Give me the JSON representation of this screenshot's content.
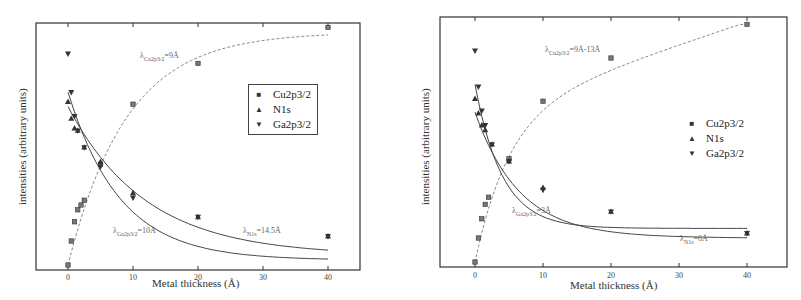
{
  "chart_data": [
    {
      "type": "scatter",
      "panel": "left",
      "title": "",
      "xlabel": "Metal thickness (Å)",
      "ylabel": "intensities (arbitrary units)",
      "xlim": [
        -5,
        45
      ],
      "ylim": [
        0,
        1
      ],
      "x_ticks": [
        "0",
        "10",
        "20",
        "30",
        "40"
      ],
      "grid": false,
      "legend": {
        "position": "upper right (boxed)",
        "entries": [
          "Cu2p3/2",
          "N1s",
          "Ga2p3/2"
        ]
      },
      "series": [
        {
          "name": "Cu2p3/2",
          "marker": "square",
          "x": [
            0,
            0.5,
            1,
            1.5,
            2,
            2.5,
            5,
            10,
            20,
            40
          ],
          "values": [
            0.0,
            0.1,
            0.18,
            0.23,
            0.25,
            0.27,
            0.42,
            0.67,
            0.84,
            0.99
          ]
        },
        {
          "name": "N1s",
          "marker": "triangle-up",
          "x": [
            0,
            0.5,
            1,
            1.5,
            2.5,
            5,
            10,
            20,
            40
          ],
          "values": [
            0.68,
            0.61,
            0.57,
            0.56,
            0.49,
            0.43,
            0.3,
            0.2,
            0.12
          ]
        },
        {
          "name": "Ga2p3/2",
          "marker": "triangle-down",
          "x": [
            0,
            0.5,
            1,
            1.5,
            2.5,
            5,
            10,
            20,
            40
          ],
          "values": [
            0.88,
            0.72,
            0.62,
            0.56,
            0.49,
            0.41,
            0.28,
            0.2,
            0.12
          ]
        }
      ],
      "fits": [
        {
          "name": "Cu2p3/2 fit",
          "style": "dashed",
          "label": "λCu2p3/2=9Å"
        },
        {
          "name": "Ga2p3/2 fit",
          "style": "solid",
          "label": "λGa2p3/2=10Å"
        },
        {
          "name": "N1s fit",
          "style": "solid",
          "label": "λN1s=14.5Å"
        }
      ]
    },
    {
      "type": "scatter",
      "panel": "right",
      "title": "",
      "xlabel": "Metal thickness (Å)",
      "ylabel": "intensities (arbitrary units)",
      "xlim": [
        -5,
        45
      ],
      "ylim": [
        0,
        1
      ],
      "x_ticks": [
        "0",
        "10",
        "20",
        "30",
        "40"
      ],
      "grid": false,
      "legend": {
        "position": "center right (no box)",
        "entries": [
          "Cu2p3/2",
          "N1s",
          "Ga2p3/2"
        ]
      },
      "series": [
        {
          "name": "Cu2p3/2",
          "marker": "square",
          "x": [
            0,
            0.5,
            1,
            1.5,
            2,
            5,
            10,
            20,
            40
          ],
          "values": [
            0.0,
            0.1,
            0.18,
            0.24,
            0.27,
            0.43,
            0.67,
            0.85,
            0.99
          ]
        },
        {
          "name": "N1s",
          "marker": "triangle-up",
          "x": [
            0,
            0.5,
            1,
            1.5,
            2.5,
            5,
            10,
            20,
            40
          ],
          "values": [
            0.68,
            0.62,
            0.57,
            0.55,
            0.49,
            0.42,
            0.31,
            0.21,
            0.12
          ]
        },
        {
          "name": "Ga2p3/2",
          "marker": "triangle-down",
          "x": [
            0,
            0.5,
            1,
            1.5,
            2.5,
            5,
            10,
            20,
            40
          ],
          "values": [
            0.88,
            0.73,
            0.63,
            0.57,
            0.49,
            0.42,
            0.3,
            0.21,
            0.12
          ]
        }
      ],
      "fits": [
        {
          "name": "Cu2p3/2 fit",
          "style": "dashed",
          "label": "λCu2p3/2=9Å-13Å"
        },
        {
          "name": "Ga2p3/2 fit",
          "style": "solid",
          "label": "λGa2p3/2=3Å"
        },
        {
          "name": "N1s fit",
          "style": "solid",
          "label": "λN1s=6Å"
        }
      ]
    }
  ],
  "left": {
    "ylabel": "intensities (arbitrary units)",
    "xlabel": "Metal thickness (Å)",
    "ticks": [
      "0",
      "10",
      "20",
      "30",
      "40"
    ],
    "legend": [
      "Cu2p3/2",
      "N1s",
      "Ga2p3/2"
    ],
    "annot_cu": "=9Å",
    "annot_cu_sub": "Cu2p3/2",
    "annot_ga": "=10Å",
    "annot_ga_sub": "Ga2p3/2",
    "annot_n": "=14.5Å",
    "annot_n_sub": "N1s",
    "lambda": "λ"
  },
  "right": {
    "ylabel": "intensities (arbitrary units)",
    "xlabel": "Metal thickness (Å)",
    "ticks": [
      "0",
      "10",
      "20",
      "30",
      "40"
    ],
    "legend": [
      "Cu2p3/2",
      "N1s",
      "Ga2p3/2"
    ],
    "annot_cu": "=9Å-13Å",
    "annot_cu_sub": "Cu2p3/2",
    "annot_ga": "=3Å",
    "annot_ga_sub": "Ga2p3/2",
    "annot_n": "=6Å",
    "annot_n_sub": "N1s",
    "lambda": "λ"
  },
  "symbols": {
    "square": "■",
    "tri_up": "▲",
    "tri_down": "▼"
  },
  "colors": {
    "axis": "#333333",
    "fit_solid": "#444444",
    "fit_dashed": "#888888",
    "marker": "#333333",
    "background": "#ffffff"
  }
}
